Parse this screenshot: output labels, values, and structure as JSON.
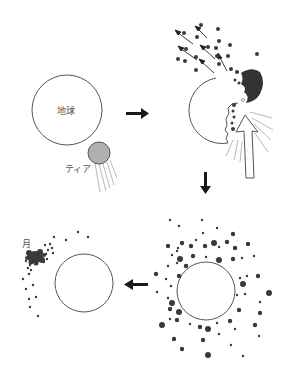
{
  "labels": {
    "earth": "地球",
    "theia": "ティア",
    "moon": "月"
  },
  "colors": {
    "outline": "#555555",
    "theia_fill": "#b0b0b0",
    "debris": "#3a3a3a",
    "arrow": "#1a1a1a",
    "background": "#ffffff"
  },
  "panels": [
    {
      "id": "approach",
      "description": "Theia approaches Earth"
    },
    {
      "id": "impact",
      "description": "Theia collides with Earth, ejecting debris"
    },
    {
      "id": "debris-ring",
      "description": "Debris forms a disk around Earth"
    },
    {
      "id": "moon-formation",
      "description": "Debris accretes into the Moon"
    }
  ],
  "flow_arrows": [
    {
      "id": "arrow-1-to-2",
      "direction": "right"
    },
    {
      "id": "arrow-2-to-3",
      "direction": "down"
    },
    {
      "id": "arrow-3-to-4",
      "direction": "left"
    }
  ]
}
